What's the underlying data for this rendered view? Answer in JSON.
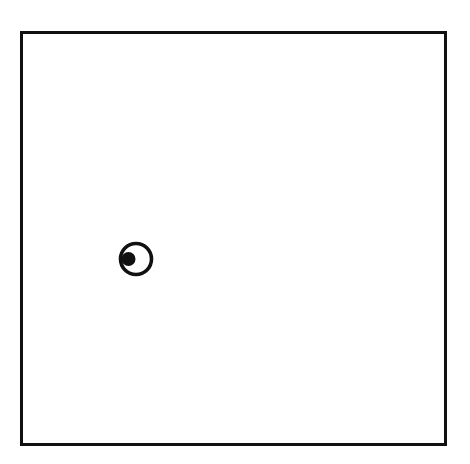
{
  "diagram": {
    "frame": {
      "stroke": "#111111",
      "fill": "#ffffff"
    },
    "marker": {
      "icon": "eye-icon",
      "ring_stroke": "#111111",
      "dot_fill": "#111111"
    }
  }
}
